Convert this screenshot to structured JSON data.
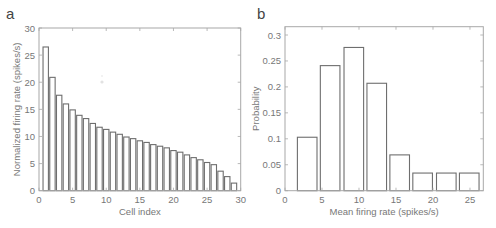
{
  "figure": {
    "panels": [
      {
        "letter": "a"
      },
      {
        "letter": "b"
      }
    ]
  },
  "chart_data": [
    {
      "type": "bar",
      "panel": "a",
      "title": "",
      "xlabel": "Cell index",
      "ylabel": "Normalized firing rate (spikes/s)",
      "xlim": [
        0,
        30
      ],
      "ylim": [
        0,
        30
      ],
      "xticks": [
        0,
        5,
        10,
        15,
        20,
        25,
        30
      ],
      "yticks": [
        0,
        5,
        10,
        15,
        20,
        25,
        30
      ],
      "grid": false,
      "legend": null,
      "categories": [
        1,
        2,
        3,
        4,
        5,
        6,
        7,
        8,
        9,
        10,
        11,
        12,
        13,
        14,
        15,
        16,
        17,
        18,
        19,
        20,
        21,
        22,
        23,
        24,
        25,
        26,
        27,
        28,
        29
      ],
      "values": [
        26.5,
        20.9,
        17.6,
        16.0,
        14.9,
        13.9,
        13.3,
        12.4,
        11.7,
        11.3,
        10.8,
        10.4,
        9.9,
        9.6,
        9.2,
        8.9,
        8.5,
        8.2,
        7.9,
        7.4,
        7.1,
        6.6,
        6.1,
        5.7,
        5.2,
        4.8,
        3.6,
        2.6,
        1.4
      ],
      "bar_width": 0.8
    },
    {
      "type": "bar",
      "panel": "b",
      "title": "",
      "xlabel": "Mean firing rate (spikes/s)",
      "ylabel": "Probability",
      "xlim": [
        0,
        26.8
      ],
      "ylim": [
        0,
        0.316
      ],
      "xticks": [
        0,
        5,
        10,
        15,
        20,
        25
      ],
      "yticks": [
        0,
        0.05,
        0.1,
        0.15,
        0.2,
        0.25,
        0.3
      ],
      "ytick_labels": [
        "0",
        "0.05",
        "0.1",
        "0.15",
        "0.2",
        "0.25",
        "0.3"
      ],
      "grid": false,
      "legend": null,
      "categories": [
        3.0,
        6.1,
        9.3,
        12.4,
        15.5,
        18.6,
        21.8,
        24.9
      ],
      "values": [
        0.103,
        0.241,
        0.276,
        0.207,
        0.069,
        0.034,
        0.034,
        0.034
      ],
      "bar_width": 2.65
    }
  ]
}
